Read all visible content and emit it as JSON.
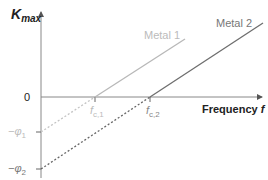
{
  "diagram": {
    "y_axis_label": "K",
    "y_axis_sub": "max",
    "x_axis_label": "Frequency ",
    "x_axis_var": "f",
    "zero_label": "0",
    "fc1_label": "f",
    "fc1_sub": "c,1",
    "fc2_label": "f",
    "fc2_sub": "c,2",
    "phi1_label": "−φ",
    "phi1_sub": "1",
    "phi2_label": "−φ",
    "phi2_sub": "2",
    "metal1_label": "Metal 1",
    "metal2_label": "Metal 2",
    "colors": {
      "metal1": "#b8b8b8",
      "metal2": "#6e6e6e",
      "axis": "#888888",
      "text_dark": "#222222"
    }
  }
}
